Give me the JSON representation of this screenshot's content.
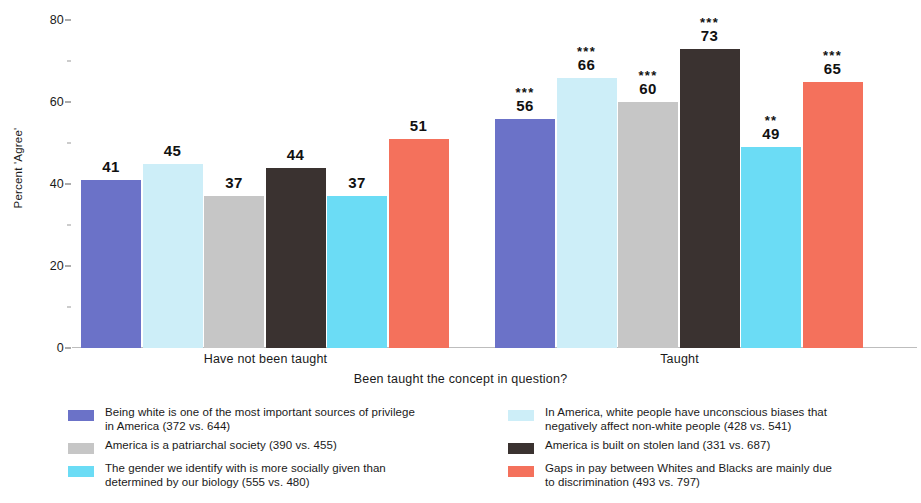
{
  "chart_data": {
    "type": "bar",
    "title": "",
    "xlabel": "Been taught the concept in question?",
    "ylabel": "Percent 'Agree'",
    "ylim": [
      0,
      82
    ],
    "yticks": [
      0,
      20,
      40,
      60,
      80
    ],
    "ytick_labels": [
      "0",
      "20",
      "40",
      "60",
      "80"
    ],
    "grid": false,
    "legend_position": "bottom",
    "categories": [
      "Have not been taught",
      "Taught"
    ],
    "series": [
      {
        "name": "Being white is one of the most important sources of privilege in America (372 vs. 644)",
        "color": "#6B72C8",
        "values": [
          41,
          56
        ],
        "significance": [
          "",
          "***"
        ]
      },
      {
        "name": "In America, white people have unconscious biases that negatively affect non-white people (428 vs. 541)",
        "color": "#CDEEF8",
        "values": [
          45,
          66
        ],
        "significance": [
          "",
          "***"
        ]
      },
      {
        "name": "America is a patriarchal society (390 vs. 455)",
        "color": "#C6C6C6",
        "values": [
          37,
          60
        ],
        "significance": [
          "",
          "***"
        ]
      },
      {
        "name": "America is built on stolen land (331 vs. 687)",
        "color": "#3A3230",
        "values": [
          44,
          73
        ],
        "significance": [
          "",
          "***"
        ]
      },
      {
        "name": "The gender we identify with is more socially given than determined by our biology (555 vs. 480)",
        "color": "#6BDCF5",
        "values": [
          37,
          49
        ],
        "significance": [
          "",
          "**"
        ]
      },
      {
        "name": "Gaps in pay between Whites and Blacks are mainly due to discrimination (493 vs. 797)",
        "color": "#F4715C",
        "values": [
          51,
          65
        ],
        "significance": [
          "",
          "***"
        ]
      }
    ]
  },
  "axes": {
    "y_title": "Percent 'Agree'",
    "x_title": "Been taught the concept in question?",
    "y_ticks": [
      "80",
      "60",
      "40",
      "20",
      "0"
    ],
    "group_labels": [
      "Have not been taught",
      "Taught"
    ]
  },
  "bars": [
    {
      "value_label": "41",
      "sig": "",
      "color": "#6B72C8",
      "series": 0,
      "group": 0
    },
    {
      "value_label": "45",
      "sig": "",
      "color": "#CDEEF8",
      "series": 1,
      "group": 0
    },
    {
      "value_label": "37",
      "sig": "",
      "color": "#C6C6C6",
      "series": 2,
      "group": 0
    },
    {
      "value_label": "44",
      "sig": "",
      "color": "#3A3230",
      "series": 3,
      "group": 0
    },
    {
      "value_label": "37",
      "sig": "",
      "color": "#6BDCF5",
      "series": 4,
      "group": 0
    },
    {
      "value_label": "51",
      "sig": "",
      "color": "#F4715C",
      "series": 5,
      "group": 0
    },
    {
      "value_label": "56",
      "sig": "***",
      "color": "#6B72C8",
      "series": 0,
      "group": 1
    },
    {
      "value_label": "66",
      "sig": "***",
      "color": "#CDEEF8",
      "series": 1,
      "group": 1
    },
    {
      "value_label": "60",
      "sig": "***",
      "color": "#C6C6C6",
      "series": 2,
      "group": 1
    },
    {
      "value_label": "73",
      "sig": "***",
      "color": "#3A3230",
      "series": 3,
      "group": 1
    },
    {
      "value_label": "49",
      "sig": "**",
      "color": "#6BDCF5",
      "series": 4,
      "group": 1
    },
    {
      "value_label": "65",
      "sig": "***",
      "color": "#F4715C",
      "series": 5,
      "group": 1
    }
  ],
  "legend": {
    "left": [
      {
        "swatch_color": "#6B72C8",
        "label": "Being white is one of the most important sources of privilege\nin America (372 vs. 644)"
      },
      {
        "swatch_color": "#C6C6C6",
        "label": "America is a patriarchal society (390 vs. 455)"
      },
      {
        "swatch_color": "#6BDCF5",
        "label": "The gender we identify with is more socially given than\ndetermined by our biology (555 vs. 480)"
      }
    ],
    "right": [
      {
        "swatch_color": "#CDEEF8",
        "label": "In America, white people have unconscious biases that\nnegatively affect non-white people (428 vs. 541)"
      },
      {
        "swatch_color": "#3A3230",
        "label": "America is built on stolen land (331 vs. 687)"
      },
      {
        "swatch_color": "#F4715C",
        "label": "Gaps in pay between Whites and Blacks are mainly due\nto discrimination (493 vs. 797)"
      }
    ]
  }
}
